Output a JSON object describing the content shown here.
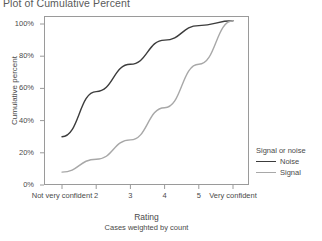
{
  "chart_title": "Plot of Cumulative Percent",
  "axes": {
    "ylabel": "Cumulative percent",
    "xlabel": "Rating",
    "xsublabel": "Cases weighted by count"
  },
  "legend": {
    "title": "Signal or noise",
    "items": [
      {
        "label": "Noise",
        "color": "#3c3c3c"
      },
      {
        "label": "Signal",
        "color": "#a8a8a8"
      }
    ]
  },
  "chart_data": {
    "type": "line",
    "title": "Plot of Cumulative Percent",
    "xlabel": "Rating",
    "ylabel": "Cumulative percent",
    "annotation": "Cases weighted by count",
    "categories": [
      "Not very confident",
      "2",
      "3",
      "4",
      "5",
      "Very confident"
    ],
    "x_tick_labels": [
      "Not very confident",
      "2",
      "3",
      "4",
      "5",
      "Very confident"
    ],
    "y_tick_labels": [
      "0%",
      "20%",
      "40%",
      "60%",
      "80%",
      "100%"
    ],
    "y_ticks": [
      0,
      20,
      40,
      60,
      80,
      100
    ],
    "ylim": [
      0,
      108
    ],
    "grid": false,
    "legend_position": "right",
    "legend_title": "Signal or noise",
    "series": [
      {
        "name": "Noise",
        "color": "#3c3c3c",
        "values": [
          30,
          58,
          75,
          90,
          99,
          102
        ]
      },
      {
        "name": "Signal",
        "color": "#a8a8a8",
        "values": [
          8,
          16,
          28,
          48,
          75,
          102
        ]
      }
    ]
  }
}
